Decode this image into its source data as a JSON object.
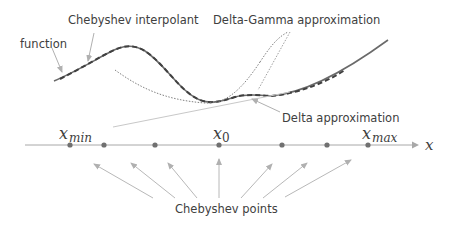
{
  "diagram": {
    "labels": {
      "function": "function",
      "chebyshev_interpolant": "Chebyshev interpolant",
      "delta_gamma": "Delta-Gamma approximation",
      "delta": "Delta approximation",
      "chebyshev_points": "Chebyshev points"
    },
    "axis": {
      "variable": "x",
      "x_min_base": "x",
      "x_min_sub": "min",
      "x0_base": "x",
      "x0_sub": "0",
      "x_max_base": "x",
      "x_max_sub": "max"
    },
    "chebyshev_point_positions_px": [
      70,
      104,
      155,
      219,
      282,
      327,
      368
    ],
    "colors": {
      "curve": "#505050",
      "arrow": "#b0b0b0",
      "axis": "#a0a0a0",
      "dot": "#707070",
      "text": "#404040"
    }
  }
}
